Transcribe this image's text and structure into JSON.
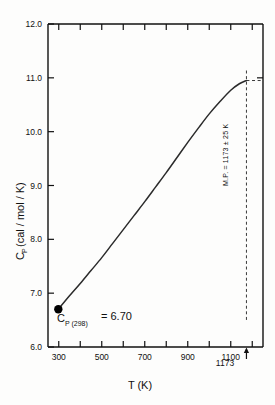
{
  "chart_data": {
    "type": "line",
    "title": "",
    "xlabel": "T (K)",
    "ylabel": "Cₚ (cal / mol / K)",
    "xlim": [
      250,
      1250
    ],
    "ylim": [
      6.0,
      12.0
    ],
    "grid": false,
    "legend": "none",
    "x_ticks": [
      300,
      500,
      700,
      900,
      1100
    ],
    "x_tick_labels": [
      "300",
      "500",
      "700",
      "900",
      "1100"
    ],
    "x_minor_step": 100,
    "y_ticks": [
      6.0,
      7.0,
      8.0,
      9.0,
      10.0,
      11.0,
      12.0
    ],
    "y_tick_labels": [
      "6.0",
      "7.0",
      "8.0",
      "9.0",
      "10.0",
      "11.0",
      "12.0"
    ],
    "series": [
      {
        "name": "Cp",
        "x": [
          298,
          350,
          400,
          450,
          500,
          550,
          600,
          650,
          700,
          750,
          800,
          850,
          900,
          950,
          1000,
          1050,
          1100,
          1140,
          1173
        ],
        "values": [
          6.7,
          6.95,
          7.18,
          7.42,
          7.66,
          7.92,
          8.18,
          8.44,
          8.7,
          8.97,
          9.24,
          9.52,
          9.8,
          10.07,
          10.33,
          10.56,
          10.77,
          10.89,
          10.95
        ]
      }
    ],
    "markers": [
      {
        "name": "cp-298-point",
        "x": 298,
        "y": 6.7
      }
    ],
    "annotations": {
      "cp298_symbol": "C",
      "cp298_subscript": "P (298)",
      "cp298_value": "= 6.70",
      "melting_point": "M.P. = 1173 ± 25 K",
      "mp_tick_label": "1173",
      "mp_x": 1173,
      "mp_y": 10.95
    }
  },
  "axis_label_parts": {
    "cp_symbol": "C",
    "cp_subscript": "P",
    "cp_units": "(cal / mol / K)"
  },
  "colors": {
    "line": "#2b2b2b",
    "axis": "#111111",
    "background": "#fdfdfc",
    "marker": "#000000",
    "dashed": "#3a3a3a"
  }
}
